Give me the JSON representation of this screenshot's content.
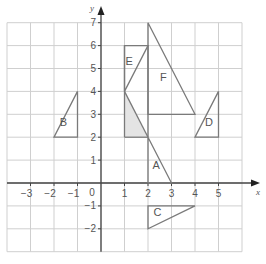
{
  "diagram": {
    "type": "coordinate-grid",
    "grid": {
      "x_min": -4,
      "x_max": 6,
      "y_min": -3,
      "y_max": 7,
      "line_color": "#cfcfcf",
      "axis_color": "#444444"
    },
    "axes": {
      "x_label": "x",
      "y_label": "y",
      "origin_label": "0",
      "x_ticks": [
        "-3",
        "-2",
        "-1",
        "1",
        "2",
        "3",
        "4",
        "5"
      ],
      "x_tick_values": [
        -3,
        -2,
        -1,
        1,
        2,
        3,
        4,
        5
      ],
      "y_ticks": [
        "7",
        "6",
        "5",
        "4",
        "3",
        "2",
        "1",
        "-1",
        "-2"
      ],
      "y_tick_values": [
        7,
        6,
        5,
        4,
        3,
        2,
        1,
        -1,
        -2
      ]
    },
    "shapes": [
      {
        "id": "A",
        "label": "A",
        "vertices": [
          [
            2,
            2
          ],
          [
            2,
            0
          ],
          [
            3,
            0
          ]
        ],
        "label_pos": [
          2.35,
          0.6
        ]
      },
      {
        "id": "B",
        "label": "B",
        "vertices": [
          [
            -2,
            2
          ],
          [
            -1,
            2
          ],
          [
            -1,
            4
          ]
        ],
        "label_pos": [
          -1.6,
          2.5
        ]
      },
      {
        "id": "C",
        "label": "C",
        "vertices": [
          [
            2,
            -1
          ],
          [
            4,
            -1
          ],
          [
            2,
            -2
          ]
        ],
        "label_pos": [
          2.4,
          -1.45
        ]
      },
      {
        "id": "D",
        "label": "D",
        "vertices": [
          [
            4,
            2
          ],
          [
            5,
            2
          ],
          [
            5,
            4
          ]
        ],
        "label_pos": [
          4.6,
          2.5
        ]
      },
      {
        "id": "E",
        "label": "E",
        "vertices": [
          [
            1,
            6
          ],
          [
            2,
            6
          ],
          [
            1,
            4
          ]
        ],
        "label_pos": [
          1.2,
          5.15
        ]
      },
      {
        "id": "F",
        "label": "F",
        "vertices": [
          [
            2,
            7
          ],
          [
            2,
            3
          ],
          [
            4,
            3
          ]
        ],
        "label_pos": [
          2.65,
          4.45
        ]
      }
    ],
    "shaded_region": {
      "vertices": [
        [
          1,
          4
        ],
        [
          1,
          2
        ],
        [
          2,
          2
        ]
      ],
      "fill": "#e4e4e4"
    },
    "extra_lines": [
      {
        "from": [
          1,
          6
        ],
        "to": [
          1,
          2
        ]
      },
      {
        "from": [
          1,
          2
        ],
        "to": [
          2,
          2
        ]
      },
      {
        "from": [
          2,
          6
        ],
        "to": [
          2,
          2
        ]
      },
      {
        "from": [
          1,
          4
        ],
        "to": [
          2,
          2
        ]
      }
    ],
    "shape_stroke": "#7a7a7a"
  }
}
